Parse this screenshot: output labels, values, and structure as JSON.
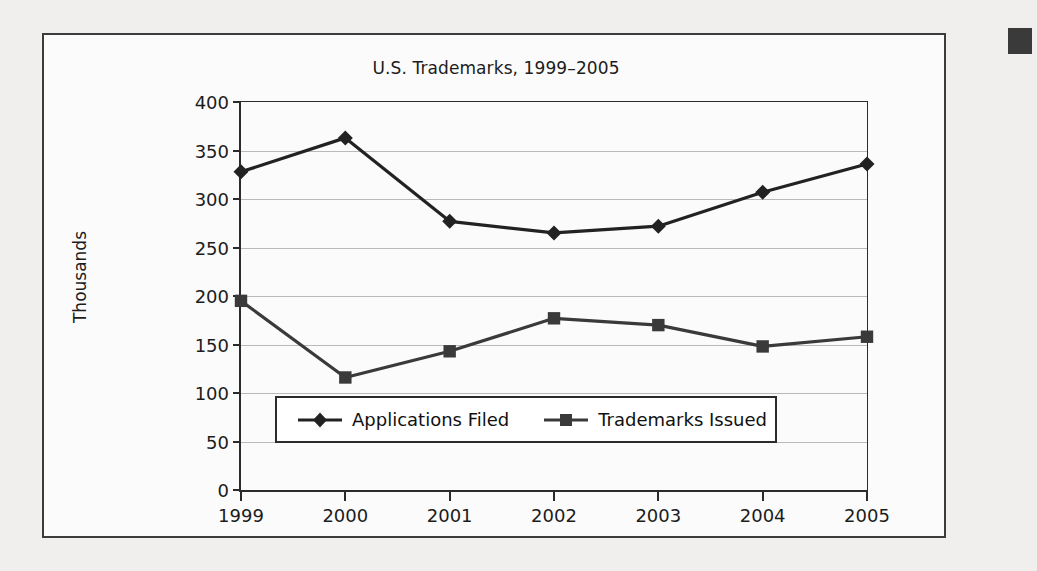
{
  "figure": {
    "title": "U.S. Trademarks, 1999–2005",
    "y_axis_title": "Thousands",
    "border_color": "#3c3c3c",
    "background": "#fbfbfb"
  },
  "corner_mark": {
    "name": "page-tab-mark",
    "color": "#3a3a3a"
  },
  "legend": {
    "entries": [
      {
        "label": "Applications Filed",
        "marker": "diamond",
        "color": "#222222"
      },
      {
        "label": "Trademarks Issued",
        "marker": "square",
        "color": "#3a3a3a"
      }
    ]
  },
  "chart_data": {
    "type": "line",
    "title": "U.S. Trademarks, 1999–2005",
    "xlabel": "",
    "ylabel": "Thousands",
    "categories": [
      "1999",
      "2000",
      "2001",
      "2002",
      "2003",
      "2004",
      "2005"
    ],
    "x": [
      1999,
      2000,
      2001,
      2002,
      2003,
      2004,
      2005
    ],
    "ylim": [
      0,
      400
    ],
    "yticks": [
      0,
      50,
      100,
      150,
      200,
      250,
      300,
      350,
      400
    ],
    "grid": true,
    "legend_position": "inside-bottom-left",
    "series": [
      {
        "name": "Applications Filed",
        "marker": "diamond",
        "color": "#222222",
        "values": [
          328,
          363,
          277,
          265,
          272,
          307,
          336
        ]
      },
      {
        "name": "Trademarks Issued",
        "marker": "square",
        "color": "#3a3a3a",
        "values": [
          195,
          116,
          143,
          177,
          170,
          148,
          158
        ]
      }
    ]
  }
}
